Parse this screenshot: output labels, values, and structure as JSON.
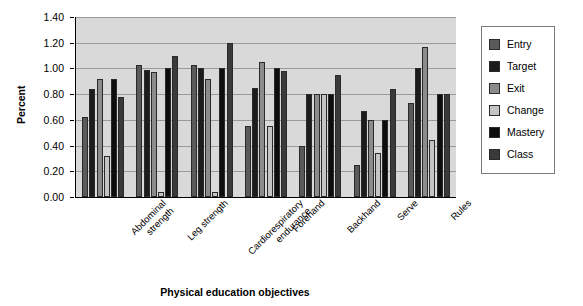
{
  "chart_data": {
    "type": "bar",
    "title": "",
    "xlabel": "Physical education objectives",
    "ylabel": "Percent",
    "ylim": [
      0.0,
      1.4
    ],
    "ytick_step": 0.2,
    "ytick_labels": [
      "0.00",
      "0.20",
      "0.40",
      "0.60",
      "0.80",
      "1.00",
      "1.20",
      "1.40"
    ],
    "ytick_values": [
      0.0,
      0.2,
      0.4,
      0.6,
      0.8,
      1.0,
      1.2,
      1.4
    ],
    "grid": true,
    "grid_axis": "y",
    "legend_position": "right",
    "plot_background": "#d9d9d9",
    "categories": [
      "Abdominal strength",
      "Leg strength",
      "Cardiorespiratory endurance",
      "Forehand",
      "Backhand",
      "Serve",
      "Rules"
    ],
    "category_lines": [
      [
        "Abdominal",
        "strength"
      ],
      [
        "Leg strength",
        ""
      ],
      [
        "Cardiorespiratory",
        "endurance"
      ],
      [
        "Forehand",
        ""
      ],
      [
        "Backhand",
        ""
      ],
      [
        "Serve",
        ""
      ],
      [
        "Rules",
        ""
      ]
    ],
    "series": [
      {
        "name": "Entry",
        "color": "#5a5a5a",
        "values": [
          0.62,
          1.03,
          1.03,
          0.55,
          0.4,
          0.25,
          0.73
        ]
      },
      {
        "name": "Target",
        "color": "#1c1c1c",
        "values": [
          0.84,
          0.99,
          1.0,
          0.85,
          0.8,
          0.67,
          1.0
        ]
      },
      {
        "name": "Exit",
        "color": "#8c8c8c",
        "values": [
          0.92,
          0.97,
          0.92,
          1.05,
          0.8,
          0.6,
          1.17
        ]
      },
      {
        "name": "Change",
        "color": "#c4c4c4",
        "values": [
          0.32,
          0.04,
          0.04,
          0.55,
          0.8,
          0.34,
          0.44
        ]
      },
      {
        "name": "Mastery",
        "color": "#0d0d0d",
        "values": [
          0.92,
          1.0,
          1.0,
          1.0,
          0.8,
          0.6,
          0.8
        ]
      },
      {
        "name": "Class",
        "color": "#3a3a3a",
        "values": [
          0.78,
          1.1,
          1.2,
          0.98,
          0.95,
          0.84,
          0.8
        ]
      }
    ]
  },
  "legend": {
    "items": [
      {
        "label": "Entry"
      },
      {
        "label": "Target"
      },
      {
        "label": "Exit"
      },
      {
        "label": "Change"
      },
      {
        "label": "Mastery"
      },
      {
        "label": "Class"
      }
    ]
  }
}
